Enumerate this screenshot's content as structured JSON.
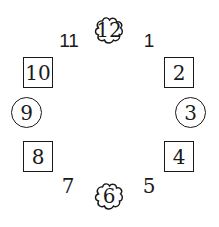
{
  "diagram": {
    "type": "clock-face-numbers",
    "numbers": [
      {
        "value": "12",
        "shape": "cloud"
      },
      {
        "value": "1",
        "shape": "none"
      },
      {
        "value": "2",
        "shape": "square"
      },
      {
        "value": "3",
        "shape": "circle"
      },
      {
        "value": "4",
        "shape": "square"
      },
      {
        "value": "5",
        "shape": "none"
      },
      {
        "value": "6",
        "shape": "cloud"
      },
      {
        "value": "7",
        "shape": "none"
      },
      {
        "value": "8",
        "shape": "square"
      },
      {
        "value": "9",
        "shape": "circle"
      },
      {
        "value": "10",
        "shape": "square"
      },
      {
        "value": "11",
        "shape": "none"
      }
    ]
  }
}
